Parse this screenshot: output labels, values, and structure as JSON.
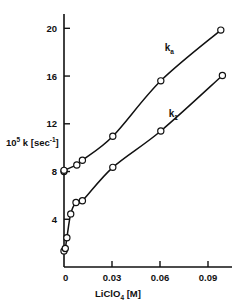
{
  "chart_data": {
    "type": "line",
    "title": "",
    "subtitle": "",
    "xlabel": "LiClO4 [M]",
    "xlabel_parts": {
      "base": "LiClO",
      "sub": "4",
      "tail": " [M]"
    },
    "ylabel": "10^5 k [sec^-1]",
    "ylabel_parts": {
      "base": "10",
      "sup": "5",
      "mid": " k [sec",
      "sup2": "-1",
      "tail": "]"
    },
    "xlim": [
      0,
      0.105
    ],
    "ylim": [
      0,
      21.2
    ],
    "xticks": [
      0,
      0.03,
      0.06,
      0.09
    ],
    "xticklabels": [
      "0",
      "0.03",
      "0.06",
      "0.09"
    ],
    "yticks": [
      4,
      8,
      12,
      16,
      20
    ],
    "yticklabels": [
      "4",
      "8",
      "12",
      "16",
      "20"
    ],
    "grid": false,
    "legend": "inline-annotations",
    "marker": "open-circle",
    "series": [
      {
        "name": "k_a",
        "label": "k",
        "label_sub": "a",
        "label_x": 0.063,
        "label_y": 18.1,
        "x": [
          0.0,
          0.0,
          0.008,
          0.0115,
          0.0305,
          0.0605,
          0.098
        ],
        "y": [
          8.0,
          8.1,
          8.55,
          8.95,
          10.95,
          15.6,
          19.85
        ]
      },
      {
        "name": "k_1",
        "label": "k",
        "label_sub": "1",
        "label_x": 0.0655,
        "label_y": 12.6,
        "x": [
          0.0,
          0.0008,
          0.0018,
          0.0042,
          0.0075,
          0.0115,
          0.0305,
          0.0605,
          0.099
        ],
        "y": [
          1.35,
          1.55,
          2.45,
          4.45,
          5.4,
          5.55,
          8.35,
          11.4,
          16.05
        ]
      }
    ]
  }
}
